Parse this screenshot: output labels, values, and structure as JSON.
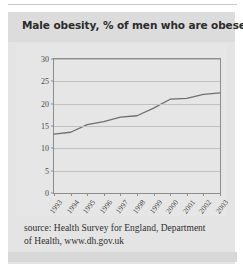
{
  "figure": {
    "title": "Male obesity, % of men who are obese",
    "source_line_1": "source: Health Survey for England, Department",
    "source_line_2": "of Health, www.dh.gov.uk"
  },
  "chart_data": {
    "type": "line",
    "title": "Male obesity, % of men who are obese",
    "xlabel": "",
    "ylabel": "",
    "x": [
      "1993",
      "1994",
      "1995",
      "1996",
      "1997",
      "1998",
      "1999",
      "2000",
      "2001",
      "2002",
      "2003"
    ],
    "values": [
      13.2,
      13.6,
      15.3,
      16.0,
      17.0,
      17.3,
      19.0,
      21.0,
      21.2,
      22.1,
      22.4
    ],
    "ylim": [
      0,
      30
    ],
    "yticks": [
      0,
      5,
      10,
      15,
      20,
      25,
      30
    ],
    "ytick_labels": [
      "0",
      "5",
      "10",
      "15",
      "20",
      "25",
      "30"
    ],
    "grid": true,
    "legend": false,
    "line_color": "#6f6f6f",
    "plot_background": "#e6e6e6"
  },
  "colors": {
    "panel_background": "#e4e4e4",
    "title_band": "#dcdcdc",
    "title_text": "#2b2b2b",
    "axis": "#8d8d8d",
    "gridline": "#c0c0c0",
    "tick_text": "#4a4a4a",
    "source_text": "#2f2f2f",
    "line": "#6f6f6f"
  }
}
